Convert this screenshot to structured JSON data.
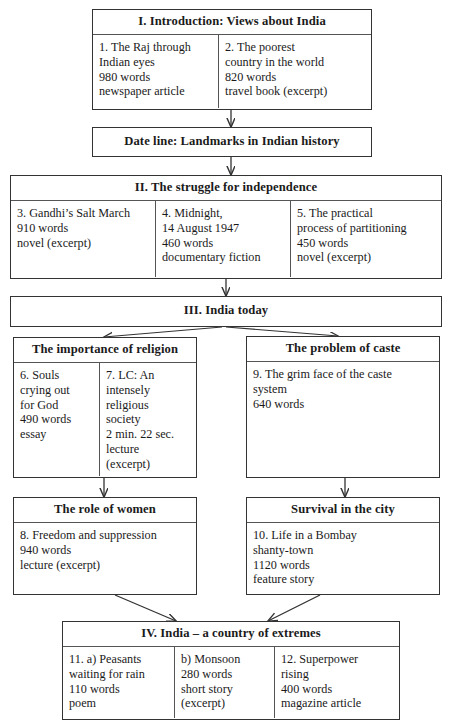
{
  "diagram": {
    "title_visible": false,
    "sections": {
      "intro": {
        "header": "I. Introduction: Views about India",
        "columns": [
          "1. The Raj through\nIndian eyes\n980 words\nnewspaper article",
          "2. The poorest\ncountry in the world\n820 words\ntravel book (excerpt)"
        ]
      },
      "dateline": {
        "header": "Date line: Landmarks in Indian history"
      },
      "struggle": {
        "header": "II. The struggle for independence",
        "columns": [
          "3. Gandhi’s Salt March\n910 words\nnovel (excerpt)",
          "4. Midnight,\n14 August 1947\n460 words\ndocumentary fiction",
          "5. The practical\nprocess of partitioning\n450 words\nnovel (excerpt)"
        ]
      },
      "today": {
        "header": "III. India today"
      },
      "religion": {
        "header": "The importance of religion",
        "columns": [
          "6. Souls\ncrying out\nfor God\n490 words\nessay",
          "7. LC: An\nintensely\nreligious\nsociety\n2 min. 22 sec.\nlecture\n(excerpt)"
        ]
      },
      "caste": {
        "header": "The problem of caste",
        "body": "9. The grim face of the caste\nsystem\n640 words"
      },
      "women": {
        "header": "The role of women",
        "body": "8. Freedom and suppression\n940 words\nlecture (excerpt)"
      },
      "city": {
        "header": "Survival in the city",
        "body": "10. Life in a Bombay\nshanty-town\n1120 words\nfeature story"
      },
      "extremes": {
        "header": "IV. India – a country of extremes",
        "columns": [
          "11. a) Peasants\nwaiting for rain\n110 words\npoem",
          "b) Monsoon\n280 words\nshort  story\n(excerpt)",
          "12.  Superpower\nrising\n400 words\nmagazine article"
        ]
      }
    },
    "colors": {
      "border": "#333333",
      "inner_rule": "#555555",
      "text": "#1a1a1a",
      "background": "#ffffff"
    }
  }
}
